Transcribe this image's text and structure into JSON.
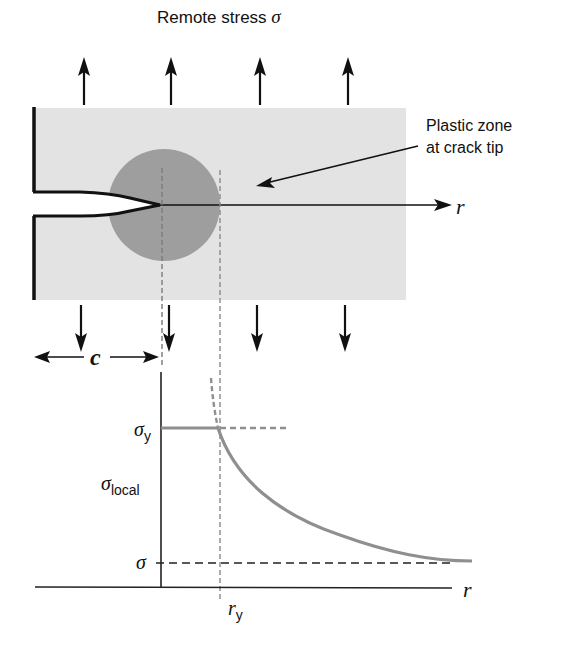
{
  "title": "Remote stress σ",
  "labels": {
    "remote_stress": "Remote stress ",
    "remote_stress_symbol": "σ",
    "plastic_zone_line1": "Plastic zone",
    "plastic_zone_line2": "at crack tip",
    "r_top": "r",
    "crack_length": "c",
    "sigma_y_base": "σ",
    "sigma_y_sub": "y",
    "sigma_local_base": "σ",
    "sigma_local_sub": "local",
    "sigma_remote": "σ",
    "r_axis": "r",
    "r_y_base": "r",
    "r_y_sub": "y"
  },
  "colors": {
    "plate": "#e3e3e3",
    "plastic_zone": "#9e9e9e",
    "curve": "#8f8f8f",
    "ink": "#111111",
    "dashed_guide": "#7a7a7a"
  },
  "plate": {
    "x": 35,
    "y": 108,
    "width": 371,
    "height": 192
  },
  "crack": {
    "mouth_x": 33,
    "upper_y": 192,
    "lower_y": 215,
    "tip_x": 160,
    "tip_y": 205
  },
  "plastic_zone": {
    "cx": 164,
    "cy": 205,
    "r": 56
  },
  "remote_arrows_up_x": [
    84,
    171,
    260,
    348
  ],
  "remote_arrows_down_x": [
    81,
    169,
    257,
    345
  ],
  "graph": {
    "origin_x": 161,
    "axis_y": 587,
    "sigma_y_level": 428,
    "sigma_level": 563,
    "r_y_x": 218
  }
}
